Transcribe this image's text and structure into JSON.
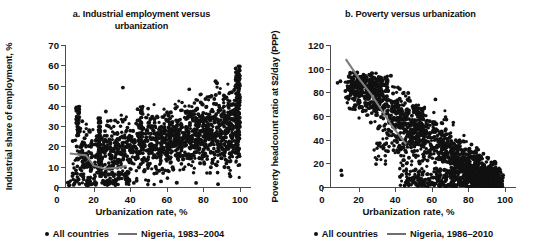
{
  "figure": {
    "panels": [
      {
        "key": "a",
        "title": "a. Industrial employment versus urbanization",
        "title_line1": "a. Industrial employment versus",
        "title_line2": "urbanization",
        "legend": {
          "points_label": "All countries",
          "line_label": "Nigeria, 1983–2004"
        }
      },
      {
        "key": "b",
        "title": "b. Poverty versus urbanization",
        "title_line1": "b. Poverty versus urbanization",
        "title_line2": "",
        "legend": {
          "points_label": "All countries",
          "line_label": "Nigeria, 1986–2010"
        }
      }
    ]
  },
  "chart_data": [
    {
      "type": "scatter",
      "panel": "a",
      "title": "a. Industrial employment versus urbanization",
      "xlabel": "Urbanization rate, %",
      "ylabel": "Industrial share of employment, %",
      "xlim": [
        0,
        100
      ],
      "ylim": [
        0,
        70
      ],
      "xticks": [
        0,
        20,
        40,
        60,
        80,
        100
      ],
      "yticks": [
        0,
        10,
        20,
        30,
        40,
        50,
        60,
        70
      ],
      "grid": false,
      "legend_position": "bottom",
      "series": [
        {
          "name": "All countries",
          "type": "scatter",
          "color": "#111111",
          "marker": "circle",
          "n_points": 1400,
          "description": "Dense cloud rising mildly from lower-left to upper-right; bulk between 10 and 45 percent industrial share across urbanization 10-100 percent; heavy concentration 15-45 percent share for urbanization above 30 percent; sparse low-share points below 10 percent at urbanization 5-35 percent; a tall vertical stack near urbanization 98-100 percent reaching 60 percent."
        },
        {
          "name": "Nigeria, 1983–2004",
          "type": "line",
          "color": "#7d7d7d",
          "points": [
            [
              7,
              16.5
            ],
            [
              12,
              16.0
            ],
            [
              16,
              15.5
            ],
            [
              20,
              10.5
            ],
            [
              26,
              9.0
            ],
            [
              33,
              9.5
            ],
            [
              38,
              10.5
            ]
          ],
          "description": "Short nearly flat gray segment around 9-17 percent industrial share over urbanization 7-38 percent."
        }
      ]
    },
    {
      "type": "scatter",
      "panel": "b",
      "title": "b. Poverty versus urbanization",
      "xlabel": "Urbanization rate, %",
      "ylabel": "Poverty headcount ratio at $2/day (PPP)",
      "xlim": [
        0,
        100
      ],
      "ylim": [
        0,
        120
      ],
      "xticks": [
        0,
        20,
        40,
        60,
        80,
        100
      ],
      "yticks": [
        0,
        20,
        40,
        60,
        80,
        100,
        120
      ],
      "grid": false,
      "legend_position": "bottom",
      "series": [
        {
          "name": "All countries",
          "type": "scatter",
          "color": "#111111",
          "marker": "circle",
          "n_points": 1100,
          "description": "Strong negative relationship; dense mass near 80-95 poverty at urbanization 10-30 percent falling to near 0-20 poverty at urbanization 60-100 percent; heavy dark band hugging the x-axis from urbanization 40 to 100 percent; isolated low points near urbanization 10 percent at poverty 10-14."
        },
        {
          "name": "Nigeria, 1986–2010",
          "type": "line",
          "color": "#7d7d7d",
          "points": [
            [
              13,
              108
            ],
            [
              20,
              92
            ],
            [
              27,
              78
            ],
            [
              33,
              64
            ],
            [
              38,
              52
            ],
            [
              42,
              44
            ],
            [
              46,
              36
            ]
          ],
          "description": "Steep descending gray segment from about 108 poverty at 13 percent urbanization down to 36 poverty at 46 percent urbanization."
        }
      ]
    }
  ]
}
